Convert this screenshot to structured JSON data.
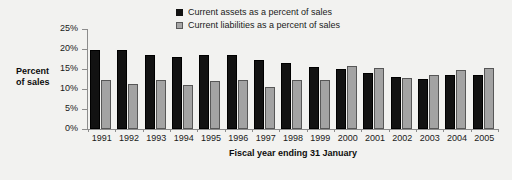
{
  "chart_data": {
    "type": "bar",
    "title": "",
    "xlabel": "Fiscal year ending 31 January",
    "ylabel": "Percent of sales",
    "ylabel_line1": "Percent",
    "ylabel_line2": "of sales",
    "ylim": [
      0,
      25
    ],
    "ytick_labels": [
      "25%",
      "20%",
      "15%",
      "10%",
      "5%",
      "0%"
    ],
    "ytick_values": [
      25,
      20,
      15,
      10,
      5,
      0
    ],
    "grid": false,
    "legend_position": "top-center",
    "categories": [
      "1991",
      "1992",
      "1993",
      "1994",
      "1995",
      "1996",
      "1997",
      "1998",
      "1999",
      "2000",
      "2001",
      "2002",
      "2003",
      "2004",
      "2005"
    ],
    "series": [
      {
        "name": "Current assets as a percent of sales",
        "color": "#121212",
        "values": [
          19.7,
          19.7,
          18.4,
          18.0,
          18.6,
          18.6,
          17.2,
          16.5,
          15.4,
          14.9,
          14.0,
          13.0,
          12.5,
          13.6,
          13.6
        ]
      },
      {
        "name": "Current liabilities as a percent of sales",
        "color": "#a3a3a3",
        "values": [
          12.2,
          11.3,
          12.2,
          10.9,
          12.0,
          12.2,
          10.4,
          12.2,
          12.2,
          15.7,
          15.2,
          12.7,
          13.4,
          14.7,
          15.2
        ]
      }
    ]
  },
  "legend": {
    "items": [
      {
        "label": "Current assets as a percent of sales",
        "swatch": "assets"
      },
      {
        "label": "Current liabilities as a percent of sales",
        "swatch": "liabilities"
      }
    ]
  }
}
